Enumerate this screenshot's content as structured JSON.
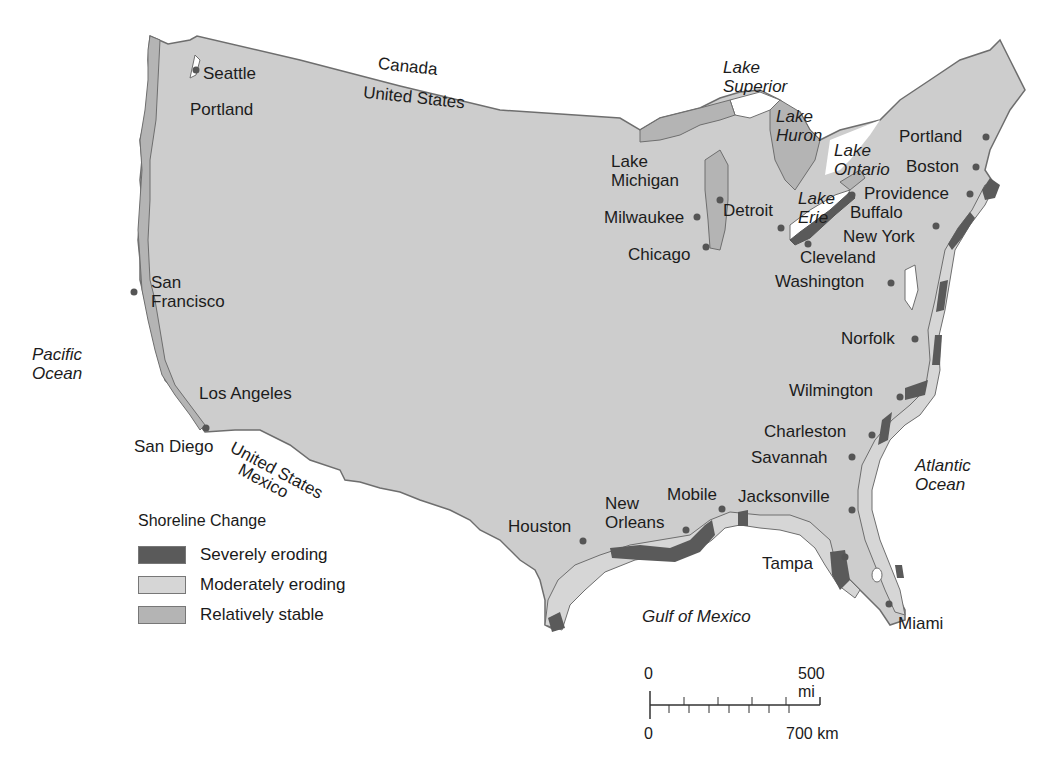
{
  "map": {
    "title": "Shoreline Change",
    "legend": {
      "title": "Shoreline Change",
      "items": [
        {
          "label": "Severely eroding",
          "color": "#5a5a5a"
        },
        {
          "label": "Moderately eroding",
          "color": "#d2d2d2"
        },
        {
          "label": "Relatively stable",
          "color": "#b4b4b4"
        }
      ]
    },
    "water_bodies": {
      "pacific": [
        "Pacific",
        "Ocean"
      ],
      "atlantic": [
        "Atlantic",
        "Ocean"
      ],
      "gulf": "Gulf of Mexico",
      "superior": [
        "Lake",
        "Superior"
      ],
      "huron": [
        "Lake",
        "Huron"
      ],
      "ontario": [
        "Lake",
        "Ontario"
      ],
      "erie": [
        "Lake",
        "Erie"
      ],
      "michigan": [
        "Lake",
        "Michigan"
      ]
    },
    "borders": {
      "canada": "Canada",
      "us_north": "United States",
      "us_south": "United States",
      "mexico": "Mexico"
    },
    "cities": {
      "seattle": "Seattle",
      "portland_or": "Portland",
      "san_francisco": [
        "San",
        "Francisco"
      ],
      "los_angeles": "Los Angeles",
      "san_diego": "San Diego",
      "milwaukee": "Milwaukee",
      "chicago": "Chicago",
      "detroit": "Detroit",
      "cleveland": "Cleveland",
      "buffalo": "Buffalo",
      "portland_me": "Portland",
      "boston": "Boston",
      "providence": "Providence",
      "new_york": "New York",
      "washington": "Washington",
      "norfolk": "Norfolk",
      "wilmington": "Wilmington",
      "charleston": "Charleston",
      "savannah": "Savannah",
      "jacksonville": "Jacksonville",
      "tampa": "Tampa",
      "miami": "Miami",
      "mobile": "Mobile",
      "new_orleans": [
        "New",
        "Orleans"
      ],
      "houston": "Houston"
    },
    "scale_bar": {
      "mi_start": "0",
      "mi_end": "500 mi",
      "km_start": "0",
      "km_end": "700 km"
    },
    "colors": {
      "land": "#cdcdcd",
      "stable": "#b4b4b4",
      "moderate": "#d6d6d6",
      "severe": "#5a5a5a",
      "outline": "#6e6e6e",
      "water": "#ffffff"
    }
  }
}
